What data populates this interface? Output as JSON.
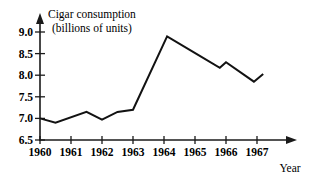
{
  "chart_data": {
    "type": "line",
    "title": "Cigar consumption (billions of units)",
    "title_line1": "Cigar consumption",
    "title_line2": "(billions of units)",
    "xlabel": "Year",
    "ylabel": "",
    "xlim": [
      1960,
      1967.6
    ],
    "ylim": [
      6.5,
      9.0
    ],
    "grid": false,
    "legend": false,
    "y_ticks": [
      "9.0",
      "8.5",
      "8.0",
      "7.5",
      "7.0",
      "6.5"
    ],
    "y_tick_values": [
      9.0,
      8.5,
      8.0,
      7.5,
      7.0,
      6.5
    ],
    "x_ticks": [
      "1960",
      "1961",
      "1962",
      "1963",
      "1964",
      "1965",
      "1966",
      "1967"
    ],
    "x_tick_values": [
      1960,
      1961,
      1962,
      1963,
      1964,
      1965,
      1966,
      1967
    ],
    "x": [
      1960.0,
      1960.5,
      1961.5,
      1962.0,
      1962.5,
      1963.0,
      1964.1,
      1965.1,
      1965.8,
      1966.0,
      1966.9,
      1967.2
    ],
    "values": [
      7.0,
      6.9,
      7.15,
      6.97,
      7.15,
      7.2,
      8.9,
      8.47,
      8.17,
      8.3,
      7.85,
      8.03
    ],
    "series": [
      {
        "name": "Cigar consumption",
        "color": "#121212",
        "points": [
          {
            "x": 1960.0,
            "y": 7.0
          },
          {
            "x": 1960.5,
            "y": 6.9
          },
          {
            "x": 1961.5,
            "y": 7.15
          },
          {
            "x": 1962.0,
            "y": 6.97
          },
          {
            "x": 1962.5,
            "y": 7.15
          },
          {
            "x": 1963.0,
            "y": 7.2
          },
          {
            "x": 1964.1,
            "y": 8.9
          },
          {
            "x": 1965.1,
            "y": 8.47
          },
          {
            "x": 1965.8,
            "y": 8.17
          },
          {
            "x": 1966.0,
            "y": 8.3
          },
          {
            "x": 1966.9,
            "y": 7.85
          },
          {
            "x": 1967.2,
            "y": 8.03
          }
        ]
      }
    ],
    "annotations": []
  },
  "colors": {
    "line": "#121212",
    "axis": "#1a1a1a",
    "background": "#ffffff"
  }
}
